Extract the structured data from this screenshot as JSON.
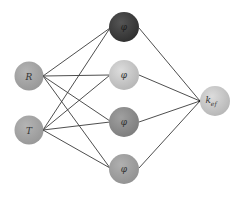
{
  "diagram": {
    "type": "neural-network",
    "input_nodes": [
      {
        "id": "R",
        "label": "R",
        "cx": 29,
        "cy": 76,
        "fill": "#a6a6a6"
      },
      {
        "id": "T",
        "label": "T",
        "cx": 29,
        "cy": 130,
        "fill": "#a6a6a6"
      }
    ],
    "hidden_nodes": [
      {
        "id": "h1",
        "label": "φ",
        "cx": 124,
        "cy": 27,
        "fill": "#3e3e3e"
      },
      {
        "id": "h2",
        "label": "φ",
        "cx": 124,
        "cy": 75,
        "fill": "#c9c9c9"
      },
      {
        "id": "h3",
        "label": "φ",
        "cx": 124,
        "cy": 122,
        "fill": "#8e8e8e"
      },
      {
        "id": "h4",
        "label": "φ",
        "cx": 124,
        "cy": 169,
        "fill": "#a3a3a3"
      }
    ],
    "output_nodes": [
      {
        "id": "kef",
        "label": "k",
        "subscript": "ef",
        "cx": 215,
        "cy": 101,
        "fill": "#c6c6c6"
      }
    ]
  }
}
